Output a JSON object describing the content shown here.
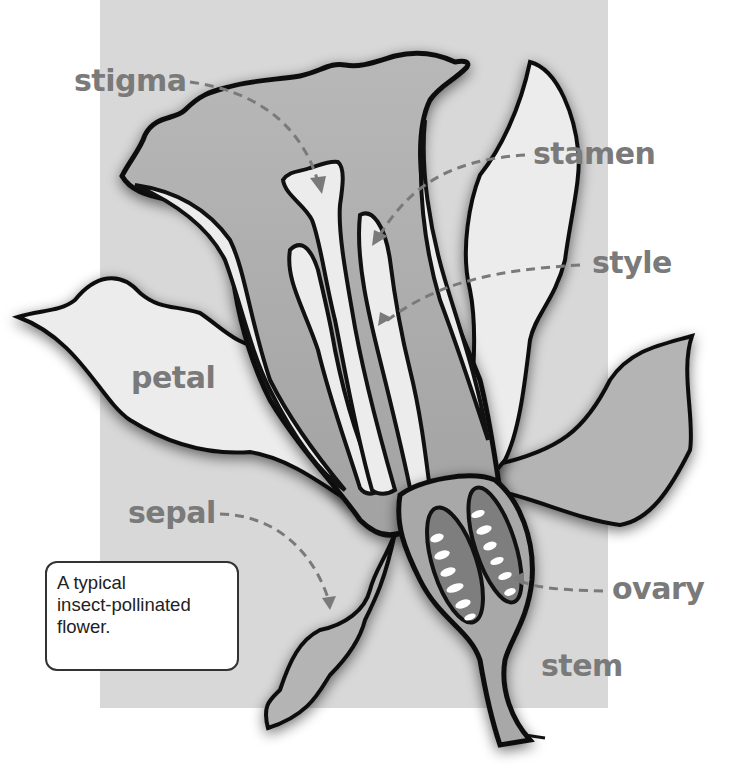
{
  "diagram": {
    "caption": {
      "lines": [
        "A typical",
        "insect-pollinated",
        "flower."
      ]
    },
    "labels": {
      "stigma": "stigma",
      "stamen": "stamen",
      "style": "style",
      "petal": "petal",
      "sepal": "sepal",
      "ovary": "ovary",
      "stem": "stem"
    },
    "colors": {
      "background_panel": "#d8d8d8",
      "label_text": "#7a7a7a",
      "outline": "#111111",
      "petal_fill": "#ececec",
      "inner_fill": "#a8a8a8",
      "sepal_fill": "#b4b4b4",
      "ovary_fill": "#7e7e7e"
    }
  }
}
